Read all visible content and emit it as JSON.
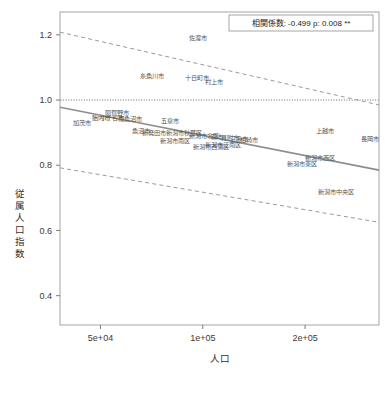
{
  "chart_data": {
    "type": "scatter",
    "title": "",
    "xlabel": "人口",
    "ylabel": "従属人口指数",
    "x_scale": "log",
    "xlim": [
      38000,
      330000
    ],
    "ylim": [
      0.31,
      1.27
    ],
    "xticks": [
      {
        "value": 50000,
        "label": "5e+04"
      },
      {
        "value": 100000,
        "label": "1e+05"
      },
      {
        "value": 200000,
        "label": "2e+05"
      }
    ],
    "yticks": [
      {
        "value": 0.4,
        "label": "0.4"
      },
      {
        "value": 0.6,
        "label": "0.6"
      },
      {
        "value": 0.8,
        "label": "0.8"
      },
      {
        "value": 1.0,
        "label": "1.0"
      },
      {
        "value": 1.2,
        "label": "1.2"
      }
    ],
    "grid": false,
    "legend": "none",
    "reference_line": {
      "y": 1.0,
      "style": "dotted",
      "color": "#555555"
    },
    "annotations": [
      {
        "name": "correlation-box",
        "text": "相関係数: -0.499   p: 0.008 **",
        "correlation": -0.499,
        "p_value": 0.008,
        "significance": "**"
      }
    ],
    "regression": {
      "color": "#8e8e8e",
      "style": "solid",
      "endpoints": [
        {
          "x": 38000,
          "y": 0.978
        },
        {
          "x": 330000,
          "y": 0.785
        }
      ]
    },
    "confidence_bands": {
      "color": "#9a9a9a",
      "style": "dashed",
      "upper": [
        {
          "x": 38000,
          "y": 1.208
        },
        {
          "x": 330000,
          "y": 0.985
        }
      ],
      "lower": [
        {
          "x": 38000,
          "y": 0.792
        },
        {
          "x": 330000,
          "y": 0.625
        }
      ]
    },
    "points": [
      {
        "label": "佐渡市",
        "x": 97000,
        "y": 1.19
      },
      {
        "label": "糸魚川市",
        "x": 71000,
        "y": 1.073
      },
      {
        "label": "十日町市",
        "x": 96000,
        "y": 1.068
      },
      {
        "label": "村上市",
        "x": 108000,
        "y": 1.055
      },
      {
        "label": "阿賀野市",
        "x": 56000,
        "y": 0.962
      },
      {
        "label": "加茂市",
        "x": 44000,
        "y": 0.93
      },
      {
        "label": "胎内市",
        "x": 50000,
        "y": 0.947
      },
      {
        "label": "小千谷市",
        "x": 54000,
        "y": 0.945
      },
      {
        "label": "南魚沼市",
        "x": 61000,
        "y": 0.943
      },
      {
        "label": "五泉市",
        "x": 80000,
        "y": 0.935
      },
      {
        "label": "魚沼市",
        "x": 66000,
        "y": 0.905
      },
      {
        "label": "新発田市",
        "x": 72000,
        "y": 0.9
      },
      {
        "label": "新潟市秋葉区",
        "x": 88000,
        "y": 0.898
      },
      {
        "label": "新潟市南区",
        "x": 83000,
        "y": 0.875
      },
      {
        "label": "新潟市北区",
        "x": 101000,
        "y": 0.89
      },
      {
        "label": "燕市",
        "x": 110000,
        "y": 0.888
      },
      {
        "label": "見附市",
        "x": 120000,
        "y": 0.885
      },
      {
        "label": "三条市",
        "x": 128000,
        "y": 0.88
      },
      {
        "label": "柏崎市",
        "x": 137000,
        "y": 0.878
      },
      {
        "label": "新潟市江南区",
        "x": 115000,
        "y": 0.862
      },
      {
        "label": "新潟市西蒲区",
        "x": 106000,
        "y": 0.858
      },
      {
        "label": "上越市",
        "x": 229000,
        "y": 0.905
      },
      {
        "label": "長岡市",
        "x": 311000,
        "y": 0.88
      },
      {
        "label": "新潟市西区",
        "x": 222000,
        "y": 0.822
      },
      {
        "label": "新潟市東区",
        "x": 196000,
        "y": 0.805
      },
      {
        "label": "新潟市中央区",
        "x": 246000,
        "y": 0.72
      }
    ]
  }
}
